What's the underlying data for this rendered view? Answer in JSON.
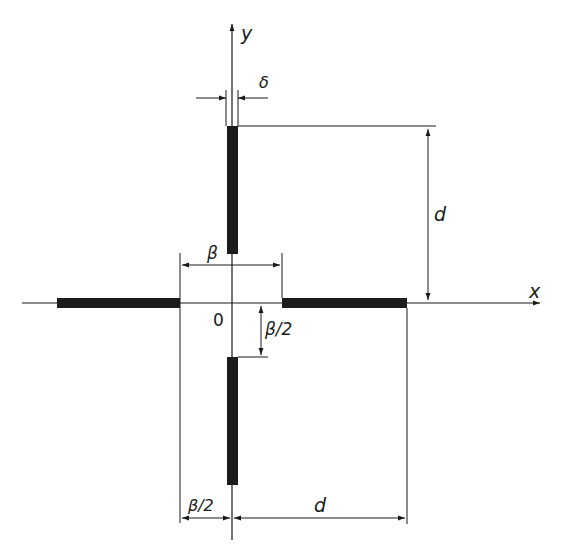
{
  "diagram": {
    "type": "cross-shaped slot arrangement with dimensions",
    "axes": {
      "x_label": "x",
      "y_label": "y",
      "origin_label": "0"
    },
    "elements": [
      {
        "name": "top-bar",
        "orientation": "vertical"
      },
      {
        "name": "bottom-bar",
        "orientation": "vertical"
      },
      {
        "name": "left-bar",
        "orientation": "horizontal"
      },
      {
        "name": "right-bar",
        "orientation": "horizontal"
      }
    ],
    "dimensions": {
      "delta": "δ",
      "beta": "β",
      "beta_half_vertical": "β/2",
      "beta_half_horizontal": "β/2",
      "d_vertical": "d",
      "d_horizontal": "d"
    },
    "colors": {
      "line": "#1a1a1a",
      "bar": "#1c1c1c",
      "background": "#ffffff"
    }
  }
}
